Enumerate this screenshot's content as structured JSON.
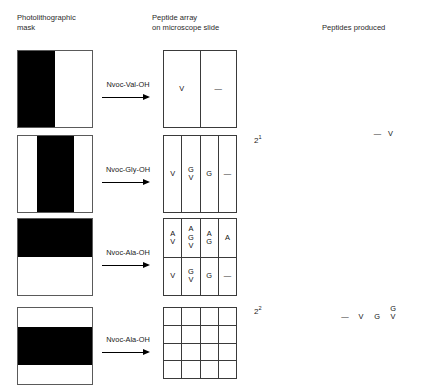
{
  "headings": {
    "mask": "Photolithographic\nmask",
    "array": "Peptide array\non microscope slide",
    "peptides": "Peptides produced"
  },
  "colors": {
    "mask_opaque": "#000000",
    "mask_transparent": "#ffffff",
    "grid_line": "#3a3a3a",
    "text": "#1a1a1a"
  },
  "rows": [
    {
      "mask_pattern": "vertical-left-half-black",
      "reagent": "Nvoc-Val-OH",
      "arrow": "right-arrow",
      "array_columns": 2,
      "array_rows": 1,
      "cells": [
        "V",
        "—"
      ],
      "count": "2",
      "count_exponent": "1",
      "peptides": [
        [
          "—"
        ],
        [
          "V"
        ]
      ]
    },
    {
      "mask_pattern": "vertical-middle-half-black",
      "reagent": "Nvoc-Gly-OH",
      "arrow": "right-arrow",
      "array_columns": 4,
      "array_rows": 1,
      "cells": [
        "V",
        "G\nV",
        "G",
        "—"
      ],
      "count": "2",
      "count_exponent": "2",
      "peptides": [
        [
          "—"
        ],
        [
          "V"
        ],
        [
          "G"
        ],
        [
          "G",
          "V"
        ]
      ]
    },
    {
      "mask_pattern": "horizontal-top-half-black",
      "reagent": "Nvoc-Ala-OH",
      "arrow": "right-arrow",
      "array_columns": 4,
      "array_rows": 2,
      "cells": [
        "A\nV",
        "A\nG\nV",
        "A\nG",
        "A",
        "V",
        "G\nV",
        "G",
        "—"
      ],
      "count": "2",
      "count_exponent": "3",
      "peptides": [
        [
          "—"
        ],
        [
          "V"
        ],
        [
          "G"
        ],
        [
          "A"
        ],
        [
          "G",
          "V"
        ],
        [
          "A",
          "V"
        ],
        [
          "A",
          "G"
        ],
        [
          "A",
          "G",
          "V"
        ]
      ]
    },
    {
      "mask_pattern": "horizontal-middle-half-black",
      "reagent": "Nvoc-Ala-OH",
      "arrow": "right-arrow",
      "array_columns": 4,
      "array_rows": 4,
      "cells": [
        "",
        "",
        "",
        "",
        "",
        "",
        "",
        "",
        "",
        "",
        "",
        "",
        "",
        "",
        "",
        ""
      ],
      "count": "2",
      "count_exponent": "4",
      "peptides": [
        [
          "—"
        ],
        [
          "V"
        ],
        [
          "G"
        ],
        [
          "A"
        ],
        [
          "L"
        ],
        [
          "G",
          "V"
        ],
        [
          "A",
          "V"
        ],
        [
          "L",
          "V"
        ],
        [
          "A",
          "G"
        ],
        [
          "L",
          "G"
        ],
        [
          "L",
          "A"
        ],
        [
          "A",
          "G",
          "V"
        ],
        [
          "L",
          "A",
          "V"
        ],
        [
          "L",
          "G",
          "V"
        ],
        [
          "L",
          "A",
          "G"
        ],
        [
          "L",
          "A",
          "G",
          "V"
        ]
      ]
    }
  ]
}
